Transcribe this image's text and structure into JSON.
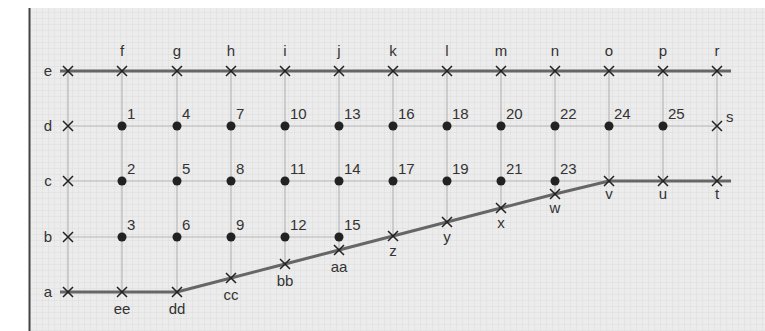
{
  "diagram": {
    "type": "grid-mesh",
    "colors": {
      "background": "#ececec",
      "fine_grid": "#dcdcdc",
      "frame": "#444444",
      "grid_line": "#b8b8b8",
      "boundary_line": "#666666",
      "marker": "#222222",
      "text": "#333333"
    },
    "columns": [
      {
        "x": 68
      },
      {
        "x": 122,
        "top": "f"
      },
      {
        "x": 177,
        "top": "g"
      },
      {
        "x": 231,
        "top": "h"
      },
      {
        "x": 285,
        "top": "i"
      },
      {
        "x": 339,
        "top": "j"
      },
      {
        "x": 393,
        "top": "k"
      },
      {
        "x": 447,
        "top": "l"
      },
      {
        "x": 501,
        "top": "m"
      },
      {
        "x": 555,
        "top": "n"
      },
      {
        "x": 609,
        "top": "o"
      },
      {
        "x": 663,
        "top": "p"
      },
      {
        "x": 717,
        "top": "r"
      }
    ],
    "rows": [
      {
        "name": "e",
        "y": 71
      },
      {
        "name": "d",
        "y": 126
      },
      {
        "name": "c",
        "y": 181
      },
      {
        "name": "b",
        "y": 237
      },
      {
        "name": "a",
        "y": 292
      }
    ],
    "row_labels": [
      "e",
      "d",
      "c",
      "b",
      "a"
    ],
    "top_labels": [
      "f",
      "g",
      "h",
      "i",
      "j",
      "k",
      "l",
      "m",
      "n",
      "o",
      "p",
      "r"
    ],
    "boundary_nodes": [
      {
        "label": "e",
        "x": 68,
        "y": 71
      },
      {
        "label": "f",
        "x": 122,
        "y": 71
      },
      {
        "label": "g",
        "x": 177,
        "y": 71
      },
      {
        "label": "h",
        "x": 231,
        "y": 71
      },
      {
        "label": "i",
        "x": 285,
        "y": 71
      },
      {
        "label": "j",
        "x": 339,
        "y": 71
      },
      {
        "label": "k",
        "x": 393,
        "y": 71
      },
      {
        "label": "l",
        "x": 447,
        "y": 71
      },
      {
        "label": "m",
        "x": 501,
        "y": 71
      },
      {
        "label": "n",
        "x": 555,
        "y": 71
      },
      {
        "label": "o",
        "x": 609,
        "y": 71
      },
      {
        "label": "p",
        "x": 663,
        "y": 71
      },
      {
        "label": "r",
        "x": 717,
        "y": 71
      },
      {
        "label": "s",
        "x": 717,
        "y": 126
      },
      {
        "label": "t",
        "x": 717,
        "y": 181
      },
      {
        "label": "u",
        "x": 663,
        "y": 181
      },
      {
        "label": "v",
        "x": 609,
        "y": 181
      },
      {
        "label": "w",
        "x": 555,
        "y": 194
      },
      {
        "label": "x",
        "x": 501,
        "y": 208
      },
      {
        "label": "y",
        "x": 447,
        "y": 222
      },
      {
        "label": "z",
        "x": 393,
        "y": 236
      },
      {
        "label": "aa",
        "x": 339,
        "y": 250
      },
      {
        "label": "bb",
        "x": 285,
        "y": 264
      },
      {
        "label": "cc",
        "x": 231,
        "y": 278
      },
      {
        "label": "dd",
        "x": 177,
        "y": 292
      },
      {
        "label": "ee",
        "x": 122,
        "y": 292
      },
      {
        "label": "a",
        "x": 68,
        "y": 292
      },
      {
        "label": "b",
        "x": 68,
        "y": 237
      },
      {
        "label": "c",
        "x": 68,
        "y": 181
      },
      {
        "label": "d",
        "x": 68,
        "y": 126
      }
    ],
    "interior_nodes": [
      {
        "label": "1",
        "x": 122,
        "y": 126
      },
      {
        "label": "2",
        "x": 122,
        "y": 181
      },
      {
        "label": "3",
        "x": 122,
        "y": 237
      },
      {
        "label": "4",
        "x": 177,
        "y": 126
      },
      {
        "label": "5",
        "x": 177,
        "y": 181
      },
      {
        "label": "6",
        "x": 177,
        "y": 237
      },
      {
        "label": "7",
        "x": 231,
        "y": 126
      },
      {
        "label": "8",
        "x": 231,
        "y": 181
      },
      {
        "label": "9",
        "x": 231,
        "y": 237
      },
      {
        "label": "10",
        "x": 285,
        "y": 126
      },
      {
        "label": "11",
        "x": 285,
        "y": 181
      },
      {
        "label": "12",
        "x": 285,
        "y": 237
      },
      {
        "label": "13",
        "x": 339,
        "y": 126
      },
      {
        "label": "14",
        "x": 339,
        "y": 181
      },
      {
        "label": "15",
        "x": 339,
        "y": 237
      },
      {
        "label": "16",
        "x": 393,
        "y": 126
      },
      {
        "label": "17",
        "x": 393,
        "y": 181
      },
      {
        "label": "18",
        "x": 447,
        "y": 126
      },
      {
        "label": "19",
        "x": 447,
        "y": 181
      },
      {
        "label": "20",
        "x": 501,
        "y": 126
      },
      {
        "label": "21",
        "x": 501,
        "y": 181
      },
      {
        "label": "22",
        "x": 555,
        "y": 126
      },
      {
        "label": "23",
        "x": 555,
        "y": 181
      },
      {
        "label": "24",
        "x": 609,
        "y": 126
      },
      {
        "label": "25",
        "x": 663,
        "y": 126
      }
    ]
  }
}
